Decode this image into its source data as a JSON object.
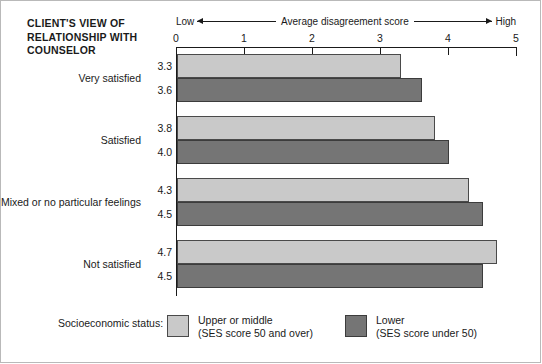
{
  "title": {
    "line1": "CLIENT'S VIEW OF",
    "line2": "RELATIONSHIP WITH",
    "line3": "COUNSELOR"
  },
  "axis_caption": {
    "low": "Low",
    "middle": "Average disagreement score",
    "high": "High"
  },
  "legend": {
    "title": "Socioeconomic status:",
    "entries": [
      {
        "label": "Upper or middle",
        "sublabel": "(SES score 50 and over)",
        "color": "#c9c9c9"
      },
      {
        "label": "Lower",
        "sublabel": "(SES score under 50)",
        "color": "#757575"
      }
    ]
  },
  "chart_data": {
    "type": "bar",
    "orientation": "horizontal",
    "title": "CLIENT'S VIEW OF RELATIONSHIP WITH COUNSELOR",
    "xlabel": "Average disagreement score",
    "ylabel": "",
    "xlim": [
      0,
      5
    ],
    "xticks": [
      0,
      1,
      2,
      3,
      4,
      5
    ],
    "xticklabels": [
      "0",
      "1",
      "2",
      "3",
      "4",
      "5"
    ],
    "grid": false,
    "legend_position": "bottom",
    "categories": [
      "Very satisfied",
      "Satisfied",
      "Mixed or no particular feelings",
      "Not satisfied"
    ],
    "series": [
      {
        "name": "Upper or middle (SES score 50 and over)",
        "color": "#c9c9c9",
        "values": [
          3.3,
          3.8,
          4.3,
          4.7
        ]
      },
      {
        "name": "Lower (SES score under 50)",
        "color": "#757575",
        "values": [
          3.6,
          4.0,
          4.5,
          4.5
        ]
      }
    ]
  }
}
